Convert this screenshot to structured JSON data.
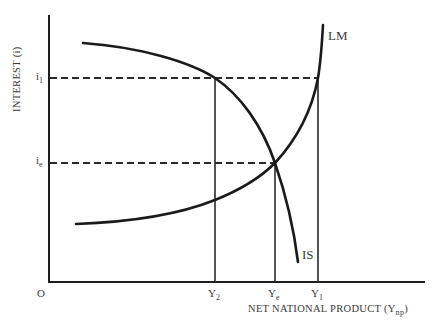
{
  "diagram": {
    "y_axis": {
      "title": "INTEREST (i)",
      "ticks": [
        {
          "base": "i",
          "sub": "1",
          "y": 78
        },
        {
          "base": "i",
          "sub": "e",
          "y": 163
        }
      ]
    },
    "x_axis": {
      "title_main": "NET NATIONAL PRODUCT (Y",
      "title_sub": "np",
      "title_end": ")",
      "origin_label": "O",
      "ticks": [
        {
          "base": "Y",
          "sub": "2",
          "x": 215
        },
        {
          "base": "Y",
          "sub": "e",
          "x": 275
        },
        {
          "base": "Y",
          "sub": "1",
          "x": 318
        }
      ]
    },
    "curves": {
      "IS": {
        "label": "IS",
        "description": "downward-sloping investment-saving curve"
      },
      "LM": {
        "label": "LM",
        "description": "upward-sloping liquidity-money curve"
      }
    },
    "equilibrium": {
      "label_i": "ie",
      "label_y": "Ye"
    },
    "colors": {
      "ink": "#1a1a1a",
      "text": "#3a3a3a",
      "background": "#ffffff"
    }
  }
}
